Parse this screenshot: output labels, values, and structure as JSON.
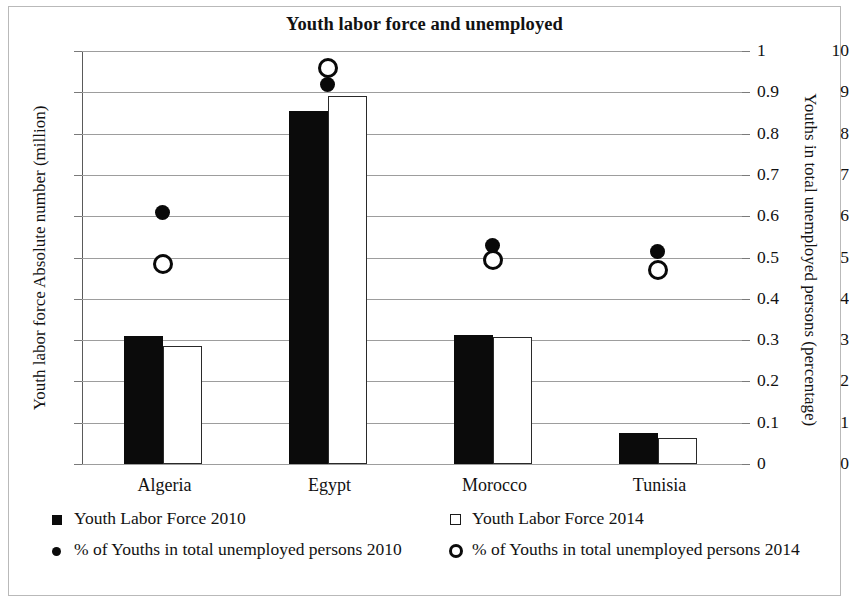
{
  "chart_data": {
    "type": "bar",
    "title": "Youth labor force and unemployed",
    "xlabel": "",
    "ylabel": "Youth labor force Absolute number (million)",
    "y2label": "Youths in total unemployed persons (percentage)",
    "categories": [
      "Algeria",
      "Egypt",
      "Morocco",
      "Tunisia"
    ],
    "ylim": [
      0,
      10
    ],
    "y2lim": [
      0,
      1
    ],
    "yticks": [
      "0",
      "1",
      "2",
      "3",
      "4",
      "5",
      "6",
      "7",
      "8",
      "9",
      "10"
    ],
    "y2ticks": [
      "0",
      "0.1",
      "0.2",
      "0.3",
      "0.4",
      "0.5",
      "0.6",
      "0.7",
      "0.8",
      "0.9",
      "1"
    ],
    "grid": true,
    "legend_position": "bottom",
    "series": [
      {
        "name": "Youth Labor Force 2010",
        "kind": "bar",
        "marker": "filled-square",
        "axis": "left",
        "values": [
          3.1,
          8.55,
          3.12,
          0.75
        ]
      },
      {
        "name": "Youth Labor Force 2014",
        "kind": "bar",
        "marker": "hollow-square",
        "axis": "left",
        "values": [
          2.85,
          8.9,
          3.08,
          0.62
        ]
      },
      {
        "name": "% of Youths in total unemployed persons 2010",
        "kind": "scatter",
        "marker": "filled-circle",
        "axis": "right",
        "values": [
          0.61,
          0.92,
          0.53,
          0.515
        ]
      },
      {
        "name": "% of Youths in total unemployed persons 2014",
        "kind": "scatter",
        "marker": "hollow-circle",
        "axis": "right",
        "values": [
          0.485,
          0.96,
          0.495,
          0.47
        ]
      }
    ]
  },
  "legend": {
    "items": [
      {
        "label": "Youth Labor Force 2010",
        "marker": "filled-square"
      },
      {
        "label": "Youth Labor Force 2014",
        "marker": "hollow-square"
      },
      {
        "label": "% of Youths in total unemployed persons 2010",
        "marker": "filled-circle"
      },
      {
        "label": "% of Youths in total unemployed persons 2014",
        "marker": "hollow-circle"
      }
    ]
  },
  "colors": {
    "series_2010": "#0b0b0b",
    "series_2014": "#ffffff",
    "series_2014_border": "#2a2a2a",
    "gridline": "#9d9d9d",
    "text": "#121212",
    "frame": "#b9b9b9"
  }
}
